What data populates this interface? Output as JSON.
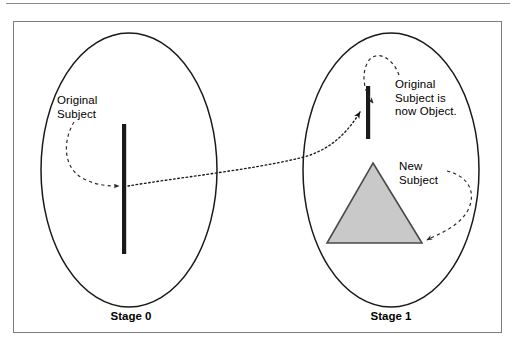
{
  "figure": {
    "background_color": "#ffffff",
    "frame_border_color": "#7d7d7d",
    "top_rule_color": "#8a8a8a"
  },
  "labels": {
    "original_subject": "Original\nSubject",
    "original_subject_now_object": "Original\nSubject is\nnow Object.",
    "new_subject": "New\nSubject",
    "stage_0": "Stage 0",
    "stage_1": "Stage 1"
  },
  "shapes": {
    "stage0_ellipse": {
      "name": "stage-0-boundary",
      "cx": 129,
      "cy": 170,
      "rx": 88,
      "ry": 137,
      "stroke": "#1a1a1a",
      "fill": "none"
    },
    "stage1_ellipse": {
      "name": "stage-1-boundary",
      "cx": 391,
      "cy": 170,
      "rx": 88,
      "ry": 137,
      "stroke": "#1a1a1a",
      "fill": "none"
    },
    "stage0_bar": {
      "name": "original-subject-bar",
      "x": 122,
      "y": 124,
      "width": 4,
      "height": 130,
      "fill": "#1a1a1a"
    },
    "stage1_bar": {
      "name": "object-bar",
      "x": 366,
      "y": 86,
      "width": 4,
      "height": 53,
      "fill": "#1a1a1a"
    },
    "triangle": {
      "name": "new-subject-triangle",
      "apex_x": 373,
      "apex_y": 163,
      "left_x": 327,
      "right_x": 422,
      "base_y": 243,
      "fill": "#c9c9c9",
      "stroke": "#4a4a4a"
    }
  },
  "connectors": {
    "stage0_leader": {
      "name": "original-subject-leader",
      "style": "dashed-arrow",
      "stroke": "#2a2a2a"
    },
    "stage1_object_leader": {
      "name": "object-leader",
      "style": "dashed-arrow",
      "stroke": "#2a2a2a"
    },
    "new_subject_leader": {
      "name": "new-subject-leader",
      "style": "dashed-arrow",
      "stroke": "#2a2a2a"
    },
    "stage_transition": {
      "name": "stage-transition-arrow",
      "style": "dotted-arrow",
      "stroke": "#1a1a1a",
      "from": "stage 0 bar",
      "to": "stage 1 bar"
    }
  },
  "colors": {
    "ink": "#1a1a1a",
    "triangle_fill": "#c9c9c9",
    "frame": "#7d7d7d"
  }
}
